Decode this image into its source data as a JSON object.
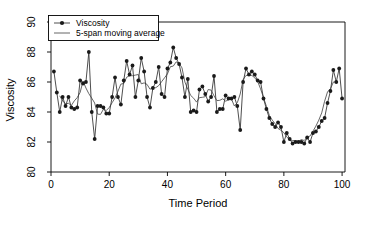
{
  "chart_data": {
    "type": "line",
    "title": "",
    "xlabel": "Time Period",
    "ylabel": "Viscosity",
    "xlim": [
      0,
      101
    ],
    "ylim": [
      80,
      90
    ],
    "xticks": [
      0,
      20,
      40,
      60,
      80,
      100
    ],
    "yticks": [
      80,
      82,
      84,
      86,
      88,
      90
    ],
    "grid": false,
    "legend_position": "top-left",
    "legend": [
      "Viscosity",
      "5-span moving average"
    ],
    "x": [
      1,
      2,
      3,
      4,
      5,
      6,
      7,
      8,
      9,
      10,
      11,
      12,
      13,
      14,
      15,
      16,
      17,
      18,
      19,
      20,
      21,
      22,
      23,
      24,
      25,
      26,
      27,
      28,
      29,
      30,
      31,
      32,
      33,
      34,
      35,
      36,
      37,
      38,
      39,
      40,
      41,
      42,
      43,
      44,
      45,
      46,
      47,
      48,
      49,
      50,
      51,
      52,
      53,
      54,
      55,
      56,
      57,
      58,
      59,
      60,
      61,
      62,
      63,
      64,
      65,
      66,
      67,
      68,
      69,
      70,
      71,
      72,
      73,
      74,
      75,
      76,
      77,
      78,
      79,
      80,
      81,
      82,
      83,
      84,
      85,
      86,
      87,
      88,
      89,
      90,
      91,
      92,
      93,
      94,
      95,
      96,
      97,
      98,
      99,
      100
    ],
    "series": [
      {
        "name": "Viscosity",
        "marker": "filled-circle",
        "values": [
          86.7,
          85.3,
          84.0,
          85.0,
          84.4,
          85.0,
          84.3,
          84.2,
          84.3,
          86.1,
          85.9,
          86.0,
          88.0,
          84.0,
          82.2,
          84.4,
          84.4,
          84.3,
          83.9,
          83.9,
          85.0,
          86.3,
          85.0,
          84.5,
          86.1,
          87.4,
          86.5,
          87.1,
          85.0,
          86.1,
          87.6,
          86.7,
          85.0,
          84.3,
          85.6,
          86.0,
          87.0,
          85.2,
          85.0,
          86.9,
          87.3,
          88.3,
          87.6,
          87.2,
          86.3,
          85.0,
          86.2,
          84.0,
          84.1,
          84.0,
          85.5,
          85.7,
          85.2,
          84.7,
          85.0,
          86.4,
          84.0,
          84.2,
          84.2,
          85.1,
          84.9,
          84.9,
          85.0,
          84.4,
          82.8,
          86.0,
          86.9,
          86.5,
          86.7,
          86.5,
          86.1,
          86.0,
          84.9,
          84.2,
          83.6,
          83.2,
          83.0,
          83.3,
          83.0,
          82.0,
          82.6,
          82.2,
          81.9,
          82.0,
          82.0,
          82.0,
          81.9,
          82.3,
          82.0,
          82.6,
          82.7,
          83.0,
          83.4,
          83.6,
          84.6,
          85.4,
          86.8,
          86.0,
          86.9,
          84.9
        ]
      },
      {
        "name": "5-span moving average",
        "marker": "none",
        "values": [
          null,
          null,
          85.08,
          84.74,
          84.54,
          84.58,
          84.44,
          84.74,
          84.96,
          85.3,
          86.06,
          85.6,
          85.22,
          84.92,
          84.6,
          83.86,
          83.84,
          84.18,
          84.1,
          84.3,
          84.62,
          84.94,
          85.38,
          85.86,
          85.9,
          86.32,
          86.42,
          86.42,
          86.46,
          86.5,
          85.88,
          85.94,
          85.84,
          85.52,
          85.62,
          85.62,
          85.76,
          86.02,
          86.28,
          86.54,
          87.02,
          87.06,
          87.34,
          87.26,
          86.94,
          86.0,
          85.52,
          85.1,
          84.92,
          84.66,
          84.96,
          84.98,
          85.02,
          85.5,
          85.46,
          85.08,
          84.76,
          84.78,
          84.88,
          84.72,
          84.82,
          84.86,
          84.4,
          84.62,
          85.2,
          86.16,
          86.44,
          86.44,
          86.44,
          86.28,
          86.04,
          85.54,
          84.96,
          84.38,
          83.78,
          83.46,
          83.22,
          82.9,
          82.78,
          82.62,
          82.34,
          82.14,
          82.1,
          82.08,
          82.04,
          82.16,
          82.1,
          82.32,
          82.4,
          82.72,
          83.06,
          83.46,
          83.94,
          84.72,
          85.34,
          85.54,
          86.0,
          86.0,
          null,
          null
        ]
      }
    ]
  }
}
